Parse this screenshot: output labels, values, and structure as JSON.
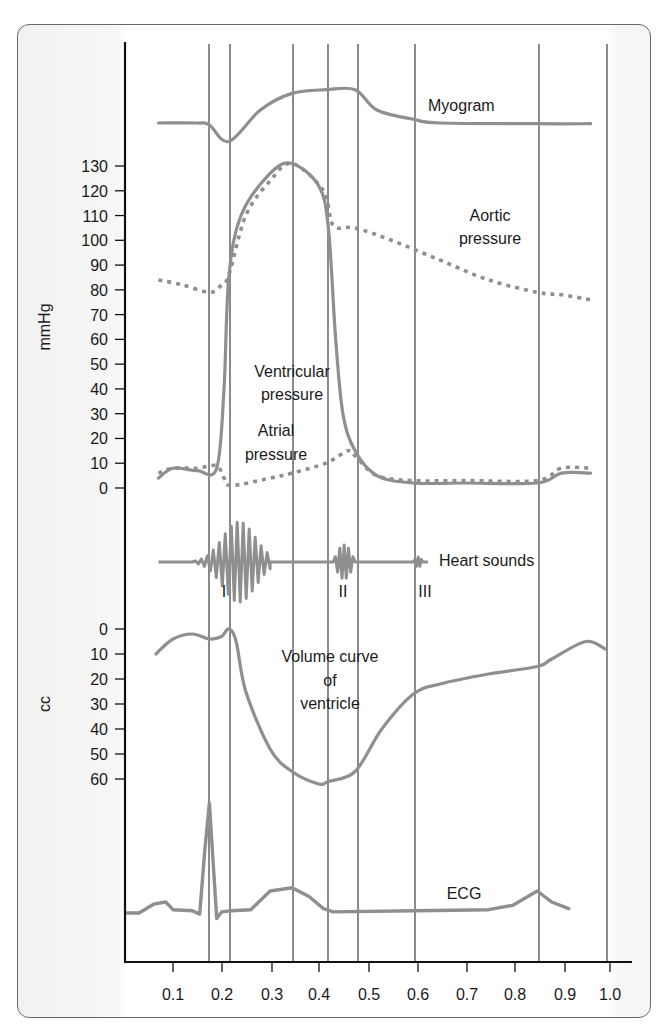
{
  "chart_data": {
    "type": "line",
    "title": "",
    "xlabel": "",
    "x_ticks": [
      "0.1",
      "0.2",
      "0.3",
      "0.4",
      "0.5",
      "0.6",
      "0.7",
      "0.8",
      "0.9",
      "1.0"
    ],
    "x_range": [
      0.0,
      1.02
    ],
    "x_unit": "seconds",
    "vertical_event_lines": [
      0.175,
      0.215,
      0.345,
      0.415,
      0.475,
      0.595,
      0.85,
      0.99
    ],
    "grid": false,
    "panels": [
      {
        "name": "Myogram",
        "ylabel": "",
        "series": [
          {
            "name": "Myogram",
            "style": "solid",
            "x": [
              0.07,
              0.15,
              0.175,
              0.215,
              0.28,
              0.345,
              0.415,
              0.475,
              0.52,
              0.595,
              0.65,
              0.85,
              0.96
            ],
            "y_relative": [
              0.0,
              0.0,
              -0.05,
              -0.5,
              0.35,
              0.8,
              0.9,
              0.9,
              0.35,
              0.1,
              0.0,
              -0.02,
              -0.02
            ]
          }
        ]
      },
      {
        "name": "Pressure",
        "ylabel": "mmHg",
        "ylim": [
          0,
          130
        ],
        "y_ticks": [
          0,
          10,
          20,
          30,
          40,
          50,
          60,
          70,
          80,
          90,
          100,
          110,
          120,
          130
        ],
        "series": [
          {
            "name": "Aortic pressure",
            "style": "dotted",
            "x": [
              0.07,
              0.12,
              0.175,
              0.2,
              0.215,
              0.25,
              0.3,
              0.345,
              0.41,
              0.43,
              0.475,
              0.55,
              0.65,
              0.75,
              0.85,
              0.9,
              0.96
            ],
            "y": [
              84,
              82,
              79,
              82,
              86,
              110,
              124,
              131,
              120,
              106,
              105,
              100,
              92,
              84,
              79,
              78,
              76
            ]
          },
          {
            "name": "Ventricular pressure",
            "style": "solid",
            "x": [
              0.07,
              0.1,
              0.15,
              0.19,
              0.205,
              0.215,
              0.24,
              0.3,
              0.345,
              0.4,
              0.42,
              0.435,
              0.45,
              0.475,
              0.52,
              0.595,
              0.7,
              0.85,
              0.9,
              0.96
            ],
            "y": [
              4,
              8,
              7,
              8,
              40,
              85,
              110,
              127,
              131,
              122,
              105,
              60,
              30,
              15,
              5,
              2,
              2,
              2,
              6,
              6
            ]
          },
          {
            "name": "Atrial pressure",
            "style": "dotted",
            "x": [
              0.07,
              0.1,
              0.15,
              0.19,
              0.205,
              0.22,
              0.3,
              0.345,
              0.415,
              0.46,
              0.475,
              0.52,
              0.595,
              0.7,
              0.85,
              0.9,
              0.96
            ],
            "y": [
              6,
              8,
              8,
              9,
              4,
              1,
              4,
              6,
              10,
              15,
              13,
              5,
              3,
              3,
              3,
              8,
              8
            ]
          }
        ]
      },
      {
        "name": "Heart sounds",
        "ylabel": "",
        "annotations": [
          {
            "label": "I",
            "x": 0.225
          },
          {
            "label": "II",
            "x": 0.44
          },
          {
            "label": "III",
            "x": 0.6
          }
        ],
        "bursts": [
          {
            "name": "I",
            "x_start": 0.14,
            "x_end": 0.3,
            "max_amplitude": 1.0
          },
          {
            "name": "II",
            "x_start": 0.43,
            "x_end": 0.475,
            "max_amplitude": 0.45
          },
          {
            "name": "III",
            "x_start": 0.595,
            "x_end": 0.615,
            "max_amplitude": 0.1
          }
        ]
      },
      {
        "name": "Volume curve of ventricle",
        "ylabel": "cc",
        "ylim": [
          0,
          60
        ],
        "y_inverted": true,
        "y_ticks": [
          0,
          10,
          20,
          30,
          40,
          50,
          60
        ],
        "series": [
          {
            "name": "Volume curve of ventricle",
            "style": "solid",
            "x": [
              0.065,
              0.1,
              0.14,
              0.175,
              0.2,
              0.215,
              0.23,
              0.25,
              0.3,
              0.345,
              0.4,
              0.42,
              0.475,
              0.53,
              0.595,
              0.65,
              0.75,
              0.85,
              0.88,
              0.95,
              0.99
            ],
            "y": [
              10,
              4,
              2,
              4,
              3,
              0,
              5,
              25,
              48,
              57,
              62,
              61,
              57,
              40,
              26,
              22,
              18,
              15,
              12,
              5,
              8
            ]
          }
        ]
      },
      {
        "name": "ECG",
        "ylabel": "",
        "series": [
          {
            "name": "ECG",
            "style": "solid",
            "x": [
              0.0,
              0.03,
              0.06,
              0.085,
              0.1,
              0.14,
              0.155,
              0.165,
              0.175,
              0.19,
              0.2,
              0.22,
              0.26,
              0.3,
              0.345,
              0.38,
              0.41,
              0.43,
              0.6,
              0.75,
              0.8,
              0.85,
              0.88,
              0.915
            ],
            "y_relative": [
              0.0,
              0.0,
              0.08,
              0.1,
              0.03,
              0.02,
              -0.01,
              0.55,
              1.0,
              -0.05,
              0.01,
              0.02,
              0.03,
              0.2,
              0.23,
              0.15,
              0.04,
              0.01,
              0.02,
              0.03,
              0.07,
              0.2,
              0.1,
              0.04
            ]
          }
        ]
      }
    ],
    "legend": [],
    "text_labels": [
      "Myogram",
      "Aortic pressure",
      "Ventricular pressure",
      "Atrial pressure",
      "Heart sounds",
      "Volume curve of ventricle",
      "ECG"
    ]
  },
  "axes": {
    "mmHg_label": "mmHg",
    "cc_label": "cc",
    "mmHg_ticks": [
      "130",
      "120",
      "110",
      "100",
      "90",
      "80",
      "70",
      "60",
      "50",
      "40",
      "30",
      "20",
      "10",
      "0"
    ],
    "cc_ticks": [
      "0",
      "10",
      "20",
      "30",
      "40",
      "50",
      "60"
    ],
    "x_ticks": [
      "0.1",
      "0.2",
      "0.3",
      "0.4",
      "0.5",
      "0.6",
      "0.7",
      "0.8",
      "0.9",
      "1.0"
    ]
  },
  "labels": {
    "myogram": "Myogram",
    "aortic_1": "Aortic",
    "aortic_2": "pressure",
    "ventricular_1": "Ventricular",
    "ventricular_2": "pressure",
    "atrial_1": "Atrial",
    "atrial_2": "pressure",
    "heart_sounds": "Heart sounds",
    "sound_I": "I",
    "sound_II": "II",
    "sound_III": "III",
    "volume_1": "Volume curve",
    "volume_2": "of",
    "volume_3": "ventricle",
    "ecg": "ECG"
  },
  "colors": {
    "curve": "#8f8f8f",
    "axis": "#111111",
    "gridline": "#2b2b2b",
    "text": "#1a1a1a",
    "frame": "#6a6a6a"
  }
}
